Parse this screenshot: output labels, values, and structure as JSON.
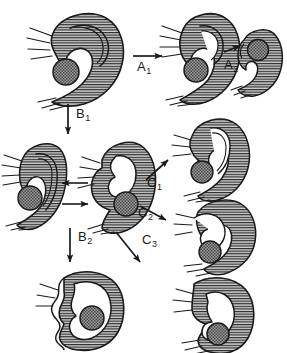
{
  "figure": {
    "type": "morphogenetic-pathway-diagram",
    "width": 287,
    "height": 353,
    "background": "#ffffff",
    "ink_color": "#1a1a1a",
    "body_fill": "#c9c9c9",
    "hatch_color": "#2b2b2b",
    "inclusion_fill": "#8c8c8c"
  },
  "transitions": [
    {
      "id": "A1",
      "label": "A",
      "subscript": "1",
      "arrow": "right",
      "from": "stage-1-top-left",
      "to": "stage-2-top-middle"
    },
    {
      "id": "A2",
      "label": "A",
      "subscript": "2",
      "arrow": "right",
      "from": "stage-2-top-middle",
      "to": "stage-3-top-right"
    },
    {
      "id": "B1",
      "label": "B",
      "subscript": "1",
      "arrow": "down",
      "from": "stage-1-top-left",
      "to": "stage-4-middle-center"
    },
    {
      "id": "B2",
      "label": "B",
      "subscript": "2",
      "arrow": "down",
      "from": "stage-4-middle-center",
      "to": "stage-8-bottom-left"
    },
    {
      "id": "C1",
      "label": "C",
      "subscript": "1",
      "arrow": "up-right",
      "from": "stage-4-middle-center",
      "to": "stage-6-middle-right-upper"
    },
    {
      "id": "C2",
      "label": "C",
      "subscript": "2",
      "arrow": "down-right",
      "from": "stage-4-middle-center",
      "to": "stage-7-middle-right-lower"
    },
    {
      "id": "C3",
      "label": "C",
      "subscript": "3",
      "arrow": "down-right",
      "from": "stage-4-middle-center",
      "to": "stage-9-bottom-right"
    },
    {
      "id": "reversible",
      "label": "",
      "subscript": "",
      "arrow": "bidirectional-horizontal",
      "from": "stage-4-middle-center",
      "to": "stage-5-middle-left"
    }
  ],
  "stages": [
    {
      "id": "stage-1-top-left",
      "name": "open-hooked-form-with-free-inclusion"
    },
    {
      "id": "stage-2-top-middle",
      "name": "narrowed-hooked-form-with-free-inclusion"
    },
    {
      "id": "stage-3-top-right",
      "name": "compact-form-with-enclosed-inclusion"
    },
    {
      "id": "stage-4-middle-center",
      "name": "lobed-form-with-engulfed-inclusion"
    },
    {
      "id": "stage-5-middle-left",
      "name": "elongated-form-with-free-inclusion"
    },
    {
      "id": "stage-6-middle-right-upper",
      "name": "curled-form-with-lateral-inclusion"
    },
    {
      "id": "stage-7-middle-right-lower",
      "name": "flared-form-with-central-inclusion"
    },
    {
      "id": "stage-8-bottom-left",
      "name": "closed-ring-form-scalloped-margin"
    },
    {
      "id": "stage-9-bottom-right",
      "name": "closed-ring-form-with-inner-lobe"
    }
  ]
}
